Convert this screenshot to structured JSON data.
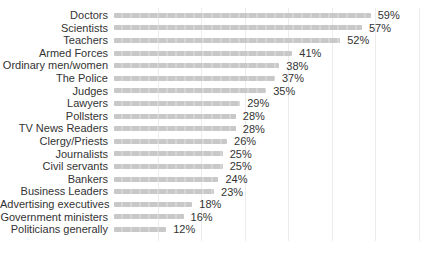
{
  "chart_data": {
    "type": "bar",
    "orientation": "horizontal",
    "title": "",
    "xlabel": "",
    "ylabel": "",
    "xlim": [
      0,
      70
    ],
    "grid": "vertical, every 10%, faint",
    "legend": "none",
    "bar_color": "#c8c8c8",
    "categories": [
      "Doctors",
      "Scientists",
      "Teachers",
      "Armed Forces",
      "Ordinary men/women",
      "The Police",
      "Judges",
      "Lawyers",
      "Pollsters",
      "TV News Readers",
      "Clergy/Priests",
      "Journalists",
      "Civil servants",
      "Bankers",
      "Business Leaders",
      "Advertising executives",
      "Government ministers",
      "Politicians generally"
    ],
    "values": [
      59,
      57,
      52,
      41,
      38,
      37,
      35,
      29,
      28,
      28,
      26,
      25,
      25,
      24,
      23,
      18,
      16,
      12
    ],
    "value_labels": [
      "59%",
      "57%",
      "52%",
      "41%",
      "38%",
      "37%",
      "35%",
      "29%",
      "28%",
      "28%",
      "26%",
      "25%",
      "25%",
      "24%",
      "23%",
      "18%",
      "16%",
      "12%"
    ]
  }
}
